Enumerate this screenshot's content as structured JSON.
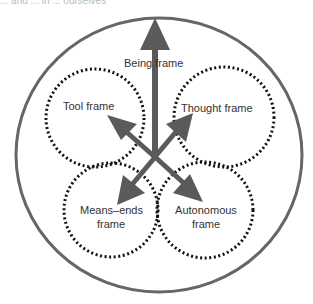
{
  "caption_fragment": "... and ... in ... ourselves",
  "diagram": {
    "outer_circle": {
      "label": "Being frame"
    },
    "frames": [
      {
        "id": "tool",
        "label": "Tool frame"
      },
      {
        "id": "thought",
        "label": "Thought frame"
      },
      {
        "id": "means_ends",
        "label_line1": "Means–ends",
        "label_line2": "frame"
      },
      {
        "id": "autonomous",
        "label_line1": "Autonomous",
        "label_line2": "frame"
      }
    ],
    "colors": {
      "arrow": "#5a5a5a",
      "outer_circle": "#666666",
      "dotted_circle": "#111111",
      "text": "#333333"
    }
  }
}
